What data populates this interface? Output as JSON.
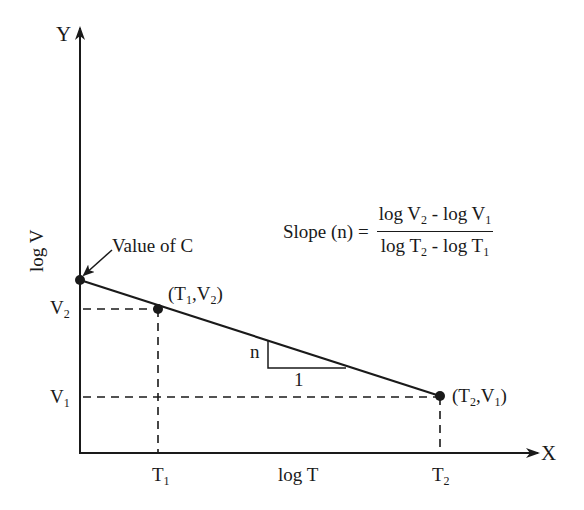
{
  "diagram": {
    "axes": {
      "y_letter": "Y",
      "x_letter": "X",
      "y_label": "log V",
      "x_label": "log T"
    },
    "ticks": {
      "y": [
        {
          "base": "V",
          "sub": "2"
        },
        {
          "base": "V",
          "sub": "1"
        }
      ],
      "x": [
        {
          "base": "T",
          "sub": "1"
        },
        {
          "base": "T",
          "sub": "2"
        }
      ]
    },
    "points": {
      "intercept_annotation": "Value of C",
      "p1": {
        "open": "(",
        "a": "T",
        "a_sub": "1",
        "sep": ",",
        "b": "V",
        "b_sub": "2",
        "close": ")"
      },
      "p2": {
        "open": "(",
        "a": "T",
        "a_sub": "2",
        "sep": ",",
        "b": "V",
        "b_sub": "1",
        "close": ")"
      }
    },
    "slope_triangle": {
      "rise": "n",
      "run": "1"
    },
    "formula": {
      "lhs": "Slope (n) =",
      "num_a": "log V",
      "num_a_sub": "2",
      "num_mid": " - log V",
      "num_b_sub": "1",
      "den_a": "log T",
      "den_a_sub": "2",
      "den_mid": " - log T",
      "den_b_sub": "1"
    },
    "colors": {
      "ink": "#1a1a1a",
      "background": "#ffffff"
    }
  }
}
